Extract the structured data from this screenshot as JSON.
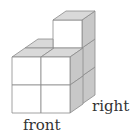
{
  "diagram": {
    "type": "isometric-cube-stack",
    "labels": {
      "right": "right",
      "front": "front"
    },
    "colors": {
      "front_face": "#ffffff",
      "top_face": "#d9d9d9",
      "side_face": "#c8c8c8",
      "edge": "#8a8a8a"
    },
    "structure": {
      "front_block": "2 x 2 cubes",
      "back_right_column": "3 cubes tall"
    }
  }
}
